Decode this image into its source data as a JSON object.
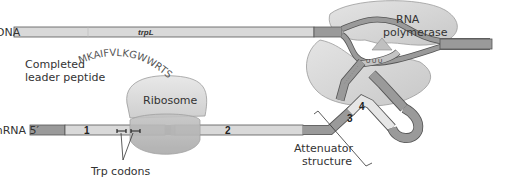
{
  "diagram": {
    "dna_label": "DNA",
    "gene_label": "trpL",
    "mrna_label": "mRNA 5′",
    "rna_polymerase_label_line1": "RNA",
    "rna_polymerase_label_line2": "polymerase",
    "completed_peptide_label_line1": "Completed",
    "completed_peptide_label_line2": "leader peptide",
    "peptide_sequence": "MKAIFVLKGWWRTS",
    "ribosome_label": "Ribosome",
    "trp_codons_label": "Trp codons",
    "attenuator_label_line1": "Attenuator",
    "attenuator_label_line2": "structure",
    "segments": {
      "seg1": "1",
      "seg2": "2",
      "seg3": "3",
      "seg4": "4"
    },
    "colors": {
      "strand_light": "#d9d9d9",
      "strand_dark": "#9a9a9a",
      "protein_fill": "#d6d6d6",
      "outline": "#555555",
      "stop_codon": "#555555"
    }
  }
}
